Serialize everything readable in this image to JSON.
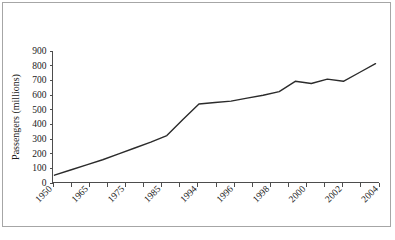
{
  "figure": {
    "background_color": "#ffffff",
    "border_color": "#a6a6a6",
    "axis_color": "#4d4d4d",
    "line_color": "#2b2b2b"
  },
  "chart_data": {
    "type": "line",
    "title": "",
    "subtitle": "",
    "xlabel": "",
    "ylabel": "Passengers (millions)",
    "ylim": [
      0,
      900
    ],
    "ytick_values": [
      0,
      100,
      200,
      300,
      400,
      500,
      600,
      700,
      800,
      900
    ],
    "ytick_labels": [
      "0",
      "100",
      "200",
      "300",
      "400",
      "500",
      "600",
      "700",
      "800",
      "900"
    ],
    "xtick_labels": [
      "1950",
      "1965",
      "1975",
      "1985",
      "1994",
      "1996",
      "1998",
      "2000",
      "2002",
      "2004"
    ],
    "xtick_count": 19,
    "grid": false,
    "legend": false,
    "legend_position": "none",
    "x_label_rotation_degrees": 45,
    "categories": [
      "1950",
      "1955",
      "1960",
      "1965",
      "1970",
      "1975",
      "1980",
      "1985",
      "1990",
      "1994",
      "1995",
      "1996",
      "1997",
      "1998",
      "1999",
      "2000",
      "2001",
      "2002",
      "2003",
      "2004",
      "2005"
    ],
    "values": [
      50,
      85,
      120,
      155,
      195,
      235,
      275,
      320,
      430,
      535,
      545,
      555,
      575,
      595,
      620,
      690,
      675,
      705,
      690,
      750,
      810
    ],
    "series": [
      {
        "name": "Passengers",
        "values": [
          50,
          85,
          120,
          155,
          195,
          235,
          275,
          320,
          430,
          535,
          545,
          555,
          575,
          595,
          620,
          690,
          675,
          705,
          690,
          750,
          810
        ]
      }
    ],
    "annotations": []
  }
}
